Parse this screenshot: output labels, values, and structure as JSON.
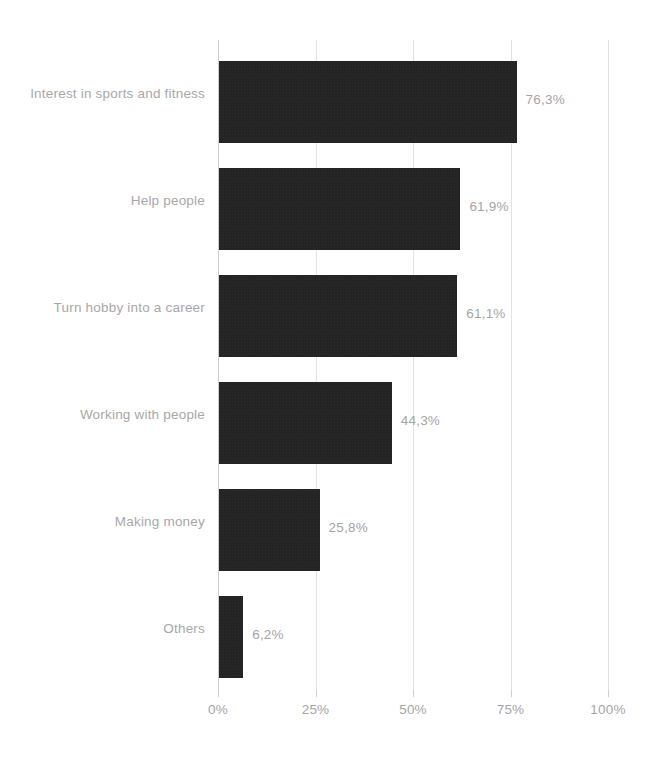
{
  "chart_data": {
    "type": "bar",
    "orientation": "horizontal",
    "title": "",
    "subtitle": "",
    "xlabel": "",
    "ylabel": "",
    "xlim": [
      0,
      100
    ],
    "grid": true,
    "legend": false,
    "value_suffix": "%",
    "decimal_separator": ",",
    "categories": [
      "Interest in sports and fitness",
      "Help people",
      "Turn hobby into a career",
      "Working with people",
      "Making money",
      "Others"
    ],
    "values": [
      76.3,
      61.9,
      61.1,
      44.3,
      25.8,
      6.2
    ],
    "value_labels": [
      "76,3%",
      "61,9%",
      "61,1%",
      "44,3%",
      "25,8%",
      "6,2%"
    ],
    "xticks": [
      0,
      25,
      50,
      75,
      100
    ],
    "xtick_labels": [
      "0%",
      "25%",
      "50%",
      "75%",
      "100%"
    ],
    "colors": {
      "bar": "#242424",
      "gridline": "#e3e3e3",
      "axis": "#cfcfcf",
      "label_text": "#a8a8a8",
      "value_text": "#a5a5a5",
      "background": "#ffffff"
    }
  }
}
